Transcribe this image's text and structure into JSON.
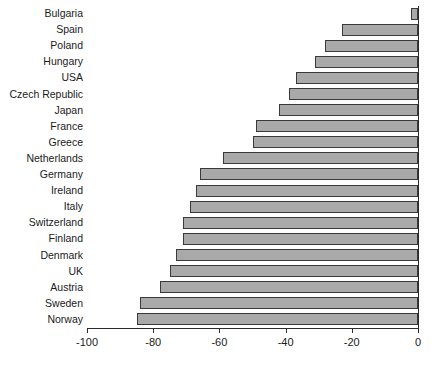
{
  "chart_data": {
    "type": "bar",
    "orientation": "horizontal",
    "title": "",
    "xlabel": "",
    "ylabel": "",
    "xlim": [
      -100,
      0
    ],
    "xticks": [
      -100,
      -80,
      -60,
      -40,
      -20,
      0
    ],
    "xticklabels": [
      "-100",
      "-80",
      "-60",
      "-40",
      "-20",
      "0"
    ],
    "grid": false,
    "legend": "none",
    "categories": [
      "Bulgaria",
      "Spain",
      "Poland",
      "Hungary",
      "USA",
      "Czech Republic",
      "Japan",
      "France",
      "Greece",
      "Netherlands",
      "Germany",
      "Ireland",
      "Italy",
      "Switzerland",
      "Finland",
      "Denmark",
      "UK",
      "Austria",
      "Sweden",
      "Norway"
    ],
    "values": [
      -2,
      -23,
      -28,
      -31,
      -37,
      -39,
      -42,
      -49,
      -50,
      -59,
      -66,
      -67,
      -69,
      -71,
      -71,
      -73,
      -75,
      -78,
      -84,
      -85
    ],
    "bar_color": "#a9a9a9",
    "bar_edge_color": "#3a3a3a"
  },
  "caption": ""
}
